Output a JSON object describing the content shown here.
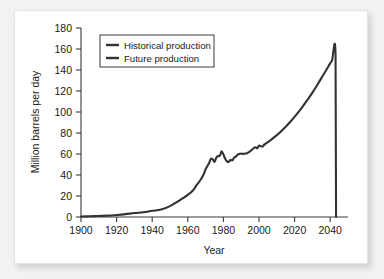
{
  "chart_data": {
    "type": "line",
    "title": "",
    "xlabel": "Year",
    "ylabel": "Million barrels per day",
    "xlim": [
      1900,
      2050
    ],
    "ylim": [
      0,
      180
    ],
    "xticks": [
      1900,
      1920,
      1940,
      1960,
      1980,
      2000,
      2020,
      2040
    ],
    "yticks": [
      0,
      20,
      40,
      60,
      80,
      100,
      120,
      140,
      160,
      180
    ],
    "grid": false,
    "legend_position": "upper-left",
    "line_color": "#333333",
    "series": [
      {
        "name": "Historical production",
        "x": [
          1900,
          1905,
          1910,
          1915,
          1920,
          1925,
          1930,
          1935,
          1940,
          1945,
          1950,
          1955,
          1960,
          1963,
          1965,
          1967,
          1969,
          1970,
          1971,
          1972,
          1973,
          1974,
          1975,
          1976,
          1977,
          1978,
          1979,
          1980,
          1981,
          1982,
          1983,
          1984,
          1985,
          1986,
          1987,
          1988,
          1989,
          1990,
          1991,
          1992,
          1993,
          1994,
          1995,
          1996,
          1997,
          1998,
          1999,
          2000,
          2001,
          2002,
          2003
        ],
        "y": [
          0.5,
          0.7,
          1.0,
          1.3,
          1.9,
          2.7,
          3.8,
          4.5,
          5.9,
          7.1,
          10.4,
          15.4,
          21.0,
          25.5,
          30.5,
          35.0,
          41.0,
          45.5,
          48.5,
          51.5,
          55.5,
          55.0,
          52.5,
          56.5,
          58.0,
          58.5,
          62.5,
          59.5,
          55.5,
          53.0,
          52.5,
          54.5,
          54.0,
          56.5,
          57.5,
          59.5,
          60.0,
          60.5,
          60.0,
          60.5,
          60.5,
          61.5,
          62.5,
          64.0,
          65.5,
          66.5,
          65.5,
          68.0,
          67.5,
          67.0,
          69.0
        ]
      },
      {
        "name": "Future production",
        "x": [
          2003,
          2006,
          2009,
          2012,
          2015,
          2018,
          2021,
          2024,
          2027,
          2030,
          2033,
          2036,
          2039,
          2041,
          2043,
          2043.3
        ],
        "y": [
          69.0,
          72.5,
          76.5,
          81.0,
          86.0,
          91.5,
          97.5,
          104.0,
          111.0,
          118.5,
          126.5,
          135.0,
          143.5,
          149.0,
          155.0,
          0.0
        ]
      }
    ],
    "annotations": [
      "Production collapses vertically to zero immediately after the ~2043 peak of about 155 million barrels per day."
    ]
  },
  "legend": {
    "entries": [
      {
        "label": "Historical production"
      },
      {
        "label": "Future production"
      }
    ]
  }
}
